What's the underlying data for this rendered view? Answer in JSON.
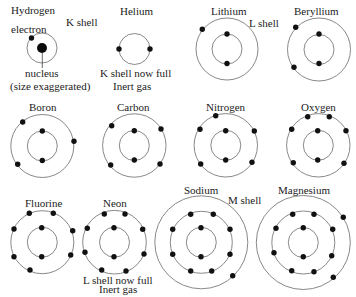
{
  "style": {
    "background": "#ffffff",
    "shell_stroke": "#7a7a7a",
    "electron_color": "#111111",
    "text_color": "#1c1c1c",
    "electron_radius": 2.7
  },
  "atoms": [
    {
      "name": "Hydrogen",
      "label": {
        "x": 11,
        "y": 14
      },
      "center": [
        42,
        48
      ],
      "nucleus_radius": 5,
      "shells": [
        {
          "name": "K",
          "radius": 15,
          "electrons": [
            [
              31.5,
              38
            ]
          ]
        }
      ]
    },
    {
      "name": "Helium",
      "label": {
        "x": 120,
        "y": 15
      },
      "center": [
        134.5,
        49
      ],
      "shells": [
        {
          "name": "K",
          "radius": 15.5,
          "electrons": [
            [
              119,
              49
            ],
            [
              150,
              49
            ]
          ]
        }
      ]
    },
    {
      "name": "Lithium",
      "label": {
        "x": 211,
        "y": 15
      },
      "center": [
        227,
        49
      ],
      "shells": [
        {
          "name": "K",
          "radius": 15,
          "electrons": [
            [
              227,
              34
            ],
            [
              227,
              63.5
            ]
          ]
        },
        {
          "name": "L",
          "radius": 31,
          "electrons": [
            [
              202.3,
              29.3
            ]
          ]
        }
      ]
    },
    {
      "name": "Beryllium",
      "label": {
        "x": 294,
        "y": 15
      },
      "center": [
        319,
        49.5
      ],
      "shells": [
        {
          "name": "K",
          "radius": 15,
          "electrons": [
            [
              319,
              34
            ],
            [
              319,
              63.5
            ]
          ]
        },
        {
          "name": "L",
          "radius": 31.5,
          "electrons": [
            [
              295.7,
              27.3
            ],
            [
              294,
              67.3
            ]
          ]
        }
      ]
    },
    {
      "name": "Boron",
      "label": {
        "x": 29,
        "y": 111
      },
      "center": [
        42.3,
        146
      ],
      "shells": [
        {
          "name": "K",
          "radius": 15,
          "electrons": [
            [
              42.3,
              131
            ],
            [
              42.3,
              160.5
            ]
          ]
        },
        {
          "name": "L",
          "radius": 31.5,
          "electrons": [
            [
              22.7,
              122
            ],
            [
              74,
              141.3
            ],
            [
              17.7,
              164.3
            ]
          ]
        }
      ]
    },
    {
      "name": "Carbon",
      "label": {
        "x": 117,
        "y": 111
      },
      "center": [
        134.3,
        145.5
      ],
      "shells": [
        {
          "name": "K",
          "radius": 15,
          "electrons": [
            [
              134.3,
              130.7
            ],
            [
              134.3,
              160
            ]
          ]
        },
        {
          "name": "L",
          "radius": 31.7,
          "electrons": [
            [
              111.7,
              125.7
            ],
            [
              161,
              129
            ],
            [
              110.7,
              165
            ],
            [
              160,
              164
            ]
          ]
        }
      ]
    },
    {
      "name": "Nitrogen",
      "label": {
        "x": 206,
        "y": 111
      },
      "center": [
        225.8,
        145.3
      ],
      "shells": [
        {
          "name": "K",
          "radius": 15,
          "electrons": [
            [
              225.7,
              130.7
            ],
            [
              225.7,
              160
            ]
          ]
        },
        {
          "name": "L",
          "radius": 31.7,
          "electrons": [
            [
              215.7,
              115.7
            ],
            [
              200,
              129.3
            ],
            [
              254.3,
              131
            ],
            [
              200.7,
              164
            ],
            [
              252,
              162.3
            ]
          ]
        }
      ]
    },
    {
      "name": "Oxygen",
      "label": {
        "x": 301,
        "y": 111
      },
      "center": [
        318.3,
        145.3
      ],
      "shells": [
        {
          "name": "K",
          "radius": 15,
          "electrons": [
            [
              317.7,
              130.7
            ],
            [
              317.7,
              160
            ]
          ]
        },
        {
          "name": "L",
          "radius": 31.7,
          "electrons": [
            [
              307.7,
              116.7
            ],
            [
              329.3,
              116.7
            ],
            [
              291.7,
              129.3
            ],
            [
              346,
              130.7
            ],
            [
              293.3,
              162.7
            ],
            [
              344,
              163.3
            ]
          ]
        }
      ]
    },
    {
      "name": "Fluorine",
      "label": {
        "x": 25,
        "y": 207
      },
      "center": [
        42.3,
        242.2
      ],
      "shells": [
        {
          "name": "K",
          "radius": 15,
          "electrons": [
            [
              41.7,
              227.7
            ],
            [
              41.7,
              256.7
            ]
          ]
        },
        {
          "name": "L",
          "radius": 31.5,
          "electrons": [
            [
              29.3,
              213.3
            ],
            [
              53.3,
              213.3
            ],
            [
              14,
              229
            ],
            [
              72.7,
              230.7
            ],
            [
              14,
              256.7
            ],
            [
              70.7,
              255
            ],
            [
              30,
              270
            ]
          ]
        }
      ]
    },
    {
      "name": "Neon",
      "label": {
        "x": 103,
        "y": 207
      },
      "center": [
        114.5,
        242.2
      ],
      "shells": [
        {
          "name": "K",
          "radius": 15,
          "electrons": [
            [
              114,
              227.7
            ],
            [
              114,
              256.7
            ]
          ]
        },
        {
          "name": "L",
          "radius": 31.8,
          "electrons": [
            [
              104.3,
              214
            ],
            [
              125,
              214
            ],
            [
              87.3,
              228.3
            ],
            [
              142.7,
              229.3
            ],
            [
              85,
              252.3
            ],
            [
              144,
              254
            ],
            [
              101.7,
              270
            ],
            [
              126,
              271
            ]
          ]
        }
      ]
    },
    {
      "name": "Sodium",
      "label": {
        "x": 184,
        "y": 194
      },
      "center": [
        201.3,
        242.3
      ],
      "shells": [
        {
          "name": "K",
          "radius": 15,
          "electrons": [
            [
              201,
              227.7
            ],
            [
              201,
              256.7
            ]
          ]
        },
        {
          "name": "L",
          "radius": 31,
          "electrons": [
            [
              190.7,
              214.3
            ],
            [
              213.3,
              214.3
            ],
            [
              172.7,
              229.3
            ],
            [
              230,
              229.3
            ],
            [
              172.7,
              254.3
            ],
            [
              230,
              254.3
            ],
            [
              190.7,
              271
            ],
            [
              211.7,
              271
            ]
          ]
        },
        {
          "name": "M",
          "radius": 46.5,
          "electrons": [
            [
              232.7,
              275.7
            ]
          ]
        }
      ]
    },
    {
      "name": "Magnesium",
      "label": {
        "x": 278,
        "y": 194
      },
      "center": [
        303.3,
        242.5
      ],
      "shells": [
        {
          "name": "K",
          "radius": 15,
          "electrons": [
            [
              303.3,
              227.7
            ],
            [
              303.3,
              256.7
            ]
          ]
        },
        {
          "name": "L",
          "radius": 31.5,
          "electrons": [
            [
              292.7,
              214.3
            ],
            [
              314,
              214.3
            ],
            [
              276,
              228.3
            ],
            [
              332.7,
              229.3
            ],
            [
              274,
              252.7
            ],
            [
              331.7,
              255.7
            ],
            [
              291.7,
              270.7
            ],
            [
              314,
              271.7
            ]
          ]
        },
        {
          "name": "M",
          "radius": 47,
          "electrons": [
            [
              343.3,
              217.3
            ],
            [
              333.3,
              277.3
            ]
          ]
        }
      ]
    }
  ],
  "annotations": [
    {
      "role": "k-shell-annotation",
      "text": "K shell",
      "x": 66,
      "y": 26
    },
    {
      "role": "electron-annotation",
      "text": "electron",
      "x": 11,
      "y": 33
    },
    {
      "role": "nucleus-annotation",
      "text": "nucleus",
      "x": 25,
      "y": 77
    },
    {
      "role": "size-note-annotation",
      "text": "(size exaggerated)",
      "x": 10,
      "y": 90
    },
    {
      "role": "helium-k-shell-full-note",
      "text": "K shell now full",
      "x": 100,
      "y": 77
    },
    {
      "role": "helium-inert-gas-note",
      "text": "Inert gas",
      "x": 113,
      "y": 90
    },
    {
      "role": "l-shell-annotation",
      "text": "L shell",
      "x": 249,
      "y": 27
    },
    {
      "role": "m-shell-annotation",
      "text": "M shell",
      "x": 228,
      "y": 204
    },
    {
      "role": "neon-l-shell-full-note",
      "text": "L shell now full",
      "x": 83,
      "y": 284
    },
    {
      "role": "neon-inert-gas-note",
      "text": "Inert gas",
      "x": 99,
      "y": 293
    }
  ],
  "leader_lines": [
    {
      "role": "nucleus-pointer-line",
      "x1": 42.3,
      "y1": 53,
      "x2": 42.3,
      "y2": 68
    }
  ]
}
